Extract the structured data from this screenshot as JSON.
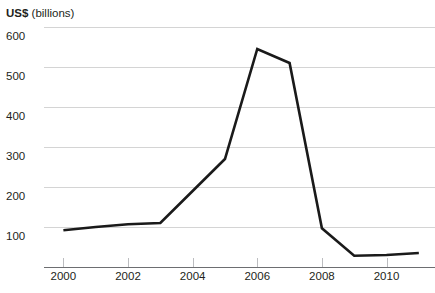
{
  "chart_data": {
    "type": "line",
    "title": "US$ (billions)",
    "title_parts": {
      "unit": "US$",
      "qualifier": " (billions)"
    },
    "xlabel": "",
    "ylabel": "US$ (billions)",
    "x": [
      2000,
      2001,
      2002,
      2003,
      2004,
      2005,
      2006,
      2007,
      2008,
      2009,
      2010,
      2011
    ],
    "values": [
      92,
      100,
      107,
      110,
      190,
      270,
      545,
      510,
      97,
      28,
      30,
      35
    ],
    "series": [
      {
        "name": "US$ (billions)",
        "values": [
          92,
          100,
          107,
          110,
          190,
          270,
          545,
          510,
          97,
          28,
          30,
          35
        ]
      }
    ],
    "ylim": [
      0,
      620
    ],
    "xlim": [
      1999.4,
      2011.5
    ],
    "yticks": [
      100,
      200,
      300,
      400,
      500,
      600
    ],
    "ytick_labels": [
      "100",
      "200",
      "300",
      "400",
      "500",
      "600"
    ],
    "xticks": [
      2000,
      2002,
      2004,
      2006,
      2008,
      2010
    ],
    "xtick_labels": [
      "2000",
      "2002",
      "2004",
      "2006",
      "2008",
      "2010"
    ],
    "grid": "horizontal",
    "legend": "none",
    "line_color": "#1a1a1a",
    "grid_color": "#d4d4d4",
    "axis_color": "#6d6e71",
    "text_color": "#231f20",
    "background": "#ffffff"
  }
}
